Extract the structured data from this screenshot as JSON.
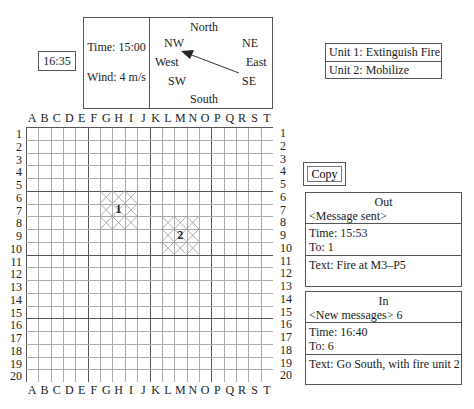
{
  "clock": "16:35",
  "weather": {
    "time": "Time: 15:00",
    "wind": "Wind: 4 m/s",
    "compass": {
      "north": "North",
      "south": "South",
      "east": "East",
      "west": "West",
      "ne": "NE",
      "nw": "NW",
      "se": "SE",
      "sw": "SW"
    },
    "wind_direction": "SE to NW"
  },
  "units": [
    {
      "label": "Unit 1: Extinguish Fire"
    },
    {
      "label": "Unit 2: Mobilize"
    }
  ],
  "map": {
    "columns": [
      "A",
      "B",
      "C",
      "D",
      "E",
      "F",
      "G",
      "H",
      "I",
      "J",
      "K",
      "L",
      "M",
      "N",
      "O",
      "P",
      "Q",
      "R",
      "S",
      "T"
    ],
    "rows": [
      "1",
      "2",
      "3",
      "4",
      "5",
      "6",
      "7",
      "8",
      "9",
      "10",
      "11",
      "12",
      "13",
      "14",
      "15",
      "16",
      "17",
      "18",
      "19",
      "20"
    ],
    "fires": [
      {
        "label": "1",
        "cols": "G-I",
        "rows": "6-8"
      },
      {
        "label": "2",
        "cols": "L-N",
        "rows": "8-10"
      }
    ]
  },
  "copy_button": "Copy",
  "out_panel": {
    "title": "Out",
    "status": "<Message sent>",
    "time": "Time: 15:53",
    "to": "To: 1",
    "text": "Text: Fire at M3–P5"
  },
  "in_panel": {
    "title": "In",
    "status": "<New messages> 6",
    "time": "Time: 16:40",
    "to": "To: 6",
    "text": "Text: Go South, with fire unit 2"
  }
}
